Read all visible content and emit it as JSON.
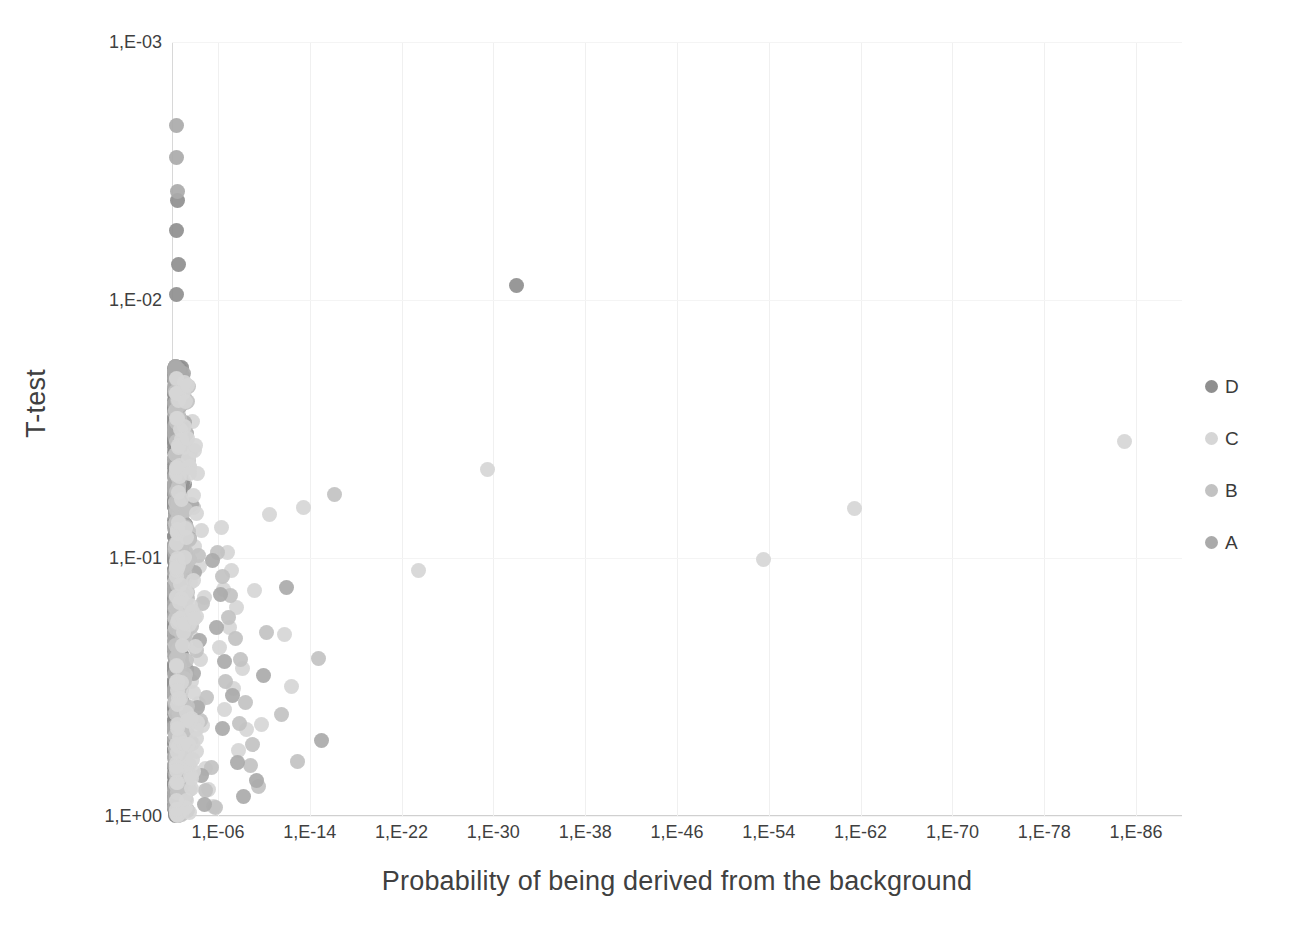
{
  "chart_data": {
    "type": "scatter",
    "title": "",
    "xlabel": "Probability of being derived from the background",
    "ylabel": "T-test",
    "x_tick_labels": [
      "1,E-06",
      "1,E-14",
      "1,E-22",
      "1,E-30",
      "1,E-38",
      "1,E-46",
      "1,E-54",
      "1,E-62",
      "1,E-70",
      "1,E-78",
      "1,E-86"
    ],
    "y_tick_labels": [
      "1,E-03",
      "1,E-02",
      "1,E-01",
      "1,E+00"
    ],
    "x_scale": "log",
    "y_scale": "log",
    "x_axis_note": "Exponent axis decreasing left-to-right from about 1,E-02 to 1,E-90",
    "y_axis_note": "Log axis from 1,E-03 (top) down to 1,E+00 (bottom)",
    "xlim_exponent": [
      -2,
      -90
    ],
    "ylim": [
      0.001,
      1.0
    ],
    "grid": "faint vertical gridlines at each x tick",
    "legend_position": "right",
    "legend": [
      {
        "name": "D",
        "color": "#8f8f8f"
      },
      {
        "name": "C",
        "color": "#d6d6d6"
      },
      {
        "name": "B",
        "color": "#c2c2c2"
      },
      {
        "name": "A",
        "color": "#aaaaaa"
      }
    ],
    "series": [
      {
        "name": "D",
        "color": "#8f8f8f",
        "points": [
          [
            -2.45,
            0.0041
          ],
          [
            -2.35,
            0.0054
          ],
          [
            -2.55,
            0.0073
          ],
          [
            -2.4,
            0.0095
          ],
          [
            -2.3,
            0.0215
          ],
          [
            -2.6,
            0.0218
          ],
          [
            -2.42,
            0.0228
          ],
          [
            -2.52,
            0.0235
          ],
          [
            -2.33,
            0.0243
          ],
          [
            -2.62,
            0.0252
          ],
          [
            -2.48,
            0.0262
          ],
          [
            -2.38,
            0.0271
          ],
          [
            -2.58,
            0.0283
          ],
          [
            -2.28,
            0.0301
          ],
          [
            -2.5,
            0.0318
          ],
          [
            -2.44,
            0.0338
          ],
          [
            -2.36,
            0.0356
          ],
          [
            -2.56,
            0.0372
          ],
          [
            -2.31,
            0.0395
          ],
          [
            -2.46,
            0.0418
          ],
          [
            -2.54,
            0.0442
          ],
          [
            -2.39,
            0.0465
          ],
          [
            -2.61,
            0.0492
          ],
          [
            -2.34,
            0.052
          ],
          [
            -2.49,
            0.0548
          ],
          [
            -2.43,
            0.058
          ],
          [
            -2.57,
            0.0612
          ],
          [
            -2.29,
            0.0648
          ],
          [
            -2.51,
            0.0684
          ],
          [
            -2.41,
            0.0722
          ],
          [
            -2.37,
            0.0762
          ],
          [
            -2.59,
            0.0805
          ],
          [
            -2.47,
            0.085
          ],
          [
            -2.32,
            0.0898
          ],
          [
            -2.53,
            0.0948
          ],
          [
            -2.45,
            0.1
          ],
          [
            -2.27,
            0.1056
          ],
          [
            -2.63,
            0.1115
          ],
          [
            -2.4,
            0.1178
          ],
          [
            -2.55,
            0.1243
          ],
          [
            -2.35,
            0.1312
          ],
          [
            -2.48,
            0.1385
          ],
          [
            -2.58,
            0.1463
          ],
          [
            -2.3,
            0.1544
          ],
          [
            -2.44,
            0.163
          ],
          [
            -2.52,
            0.1721
          ],
          [
            -2.38,
            0.1816
          ],
          [
            -2.6,
            0.1917
          ],
          [
            -2.33,
            0.2024
          ],
          [
            -2.5,
            0.2136
          ],
          [
            -2.42,
            0.2255
          ],
          [
            -2.56,
            0.238
          ],
          [
            -2.28,
            0.2512
          ],
          [
            -2.46,
            0.2651
          ],
          [
            -2.54,
            0.2799
          ],
          [
            -2.36,
            0.2954
          ],
          [
            -2.62,
            0.3118
          ],
          [
            -2.31,
            0.3291
          ],
          [
            -2.49,
            0.3474
          ],
          [
            -2.43,
            0.3666
          ],
          [
            -2.57,
            0.387
          ],
          [
            -2.34,
            0.4085
          ],
          [
            -2.51,
            0.4311
          ],
          [
            -2.39,
            0.455
          ],
          [
            -2.59,
            0.4803
          ],
          [
            -2.29,
            0.5069
          ],
          [
            -2.47,
            0.535
          ],
          [
            -2.53,
            0.5647
          ],
          [
            -2.37,
            0.596
          ],
          [
            -2.61,
            0.6291
          ],
          [
            -2.32,
            0.664
          ],
          [
            -2.45,
            0.7008
          ],
          [
            -2.55,
            0.7397
          ],
          [
            -2.41,
            0.7807
          ],
          [
            -2.27,
            0.824
          ],
          [
            -2.63,
            0.8697
          ],
          [
            -2.4,
            0.918
          ],
          [
            -2.5,
            0.969
          ],
          [
            -2.44,
            0.995
          ],
          [
            -2.7,
            0.0225
          ],
          [
            -2.75,
            0.0237
          ],
          [
            -2.8,
            0.031
          ],
          [
            -2.72,
            0.0432
          ],
          [
            -2.78,
            0.0505
          ],
          [
            -2.85,
            0.064
          ],
          [
            -2.68,
            0.073
          ],
          [
            -2.9,
            0.081
          ],
          [
            -2.74,
            0.0925
          ],
          [
            -2.82,
            0.107
          ],
          [
            -2.66,
            0.119
          ],
          [
            -2.88,
            0.136
          ],
          [
            -2.76,
            0.153
          ],
          [
            -2.7,
            0.175
          ],
          [
            -2.84,
            0.199
          ],
          [
            -2.64,
            0.227
          ],
          [
            -2.92,
            0.258
          ],
          [
            -2.79,
            0.292
          ],
          [
            -2.71,
            0.332
          ],
          [
            -2.86,
            0.376
          ],
          [
            -2.67,
            0.426
          ],
          [
            -2.94,
            0.483
          ],
          [
            -2.77,
            0.546
          ],
          [
            -2.73,
            0.618
          ],
          [
            -2.89,
            0.699
          ],
          [
            -2.65,
            0.79
          ],
          [
            -2.81,
            0.892
          ],
          [
            -2.83,
            0.96
          ],
          [
            -3.05,
            0.052
          ],
          [
            -3.15,
            0.074
          ],
          [
            -3.0,
            0.103
          ],
          [
            -3.22,
            0.142
          ],
          [
            -3.1,
            0.196
          ],
          [
            -3.3,
            0.27
          ],
          [
            -3.08,
            0.372
          ],
          [
            -3.25,
            0.512
          ],
          [
            -3.02,
            0.69
          ],
          [
            -3.18,
            0.86
          ],
          [
            -3.35,
            0.95
          ],
          [
            -32.0,
            0.0088
          ]
        ]
      },
      {
        "name": "C",
        "color": "#d6d6d6",
        "points": [
          [
            -2.45,
            0.0205
          ],
          [
            -2.55,
            0.0268
          ],
          [
            -2.38,
            0.034
          ],
          [
            -2.62,
            0.043
          ],
          [
            -2.48,
            0.0545
          ],
          [
            -2.33,
            0.069
          ],
          [
            -2.58,
            0.0875
          ],
          [
            -2.42,
            0.1105
          ],
          [
            -2.52,
            0.14
          ],
          [
            -2.36,
            0.177
          ],
          [
            -2.65,
            0.224
          ],
          [
            -2.46,
            0.284
          ],
          [
            -2.56,
            0.359
          ],
          [
            -2.31,
            0.455
          ],
          [
            -2.5,
            0.576
          ],
          [
            -2.4,
            0.729
          ],
          [
            -2.6,
            0.922
          ],
          [
            -3.8,
            0.0295
          ],
          [
            -4.2,
            0.047
          ],
          [
            -3.5,
            0.062
          ],
          [
            -4.6,
            0.078
          ],
          [
            -4.0,
            0.0905
          ],
          [
            -4.4,
            0.108
          ],
          [
            -3.6,
            0.124
          ],
          [
            -4.8,
            0.142
          ],
          [
            -4.1,
            0.168
          ],
          [
            -3.9,
            0.205
          ],
          [
            -4.5,
            0.248
          ],
          [
            -3.7,
            0.302
          ],
          [
            -4.3,
            0.368
          ],
          [
            -4.7,
            0.445
          ],
          [
            -3.4,
            0.54
          ],
          [
            -4.9,
            0.655
          ],
          [
            -5.2,
            0.79
          ],
          [
            -5.6,
            0.92
          ],
          [
            -6.3,
            0.076
          ],
          [
            -6.8,
            0.095
          ],
          [
            -7.2,
            0.112
          ],
          [
            -6.5,
            0.133
          ],
          [
            -7.6,
            0.156
          ],
          [
            -7.0,
            0.186
          ],
          [
            -6.1,
            0.223
          ],
          [
            -8.1,
            0.267
          ],
          [
            -7.4,
            0.32
          ],
          [
            -6.6,
            0.385
          ],
          [
            -8.5,
            0.462
          ],
          [
            -7.8,
            0.555
          ],
          [
            -9.2,
            0.134
          ],
          [
            -10.5,
            0.068
          ],
          [
            -13.5,
            0.064
          ],
          [
            -11.8,
            0.198
          ],
          [
            -12.4,
            0.315
          ],
          [
            -9.8,
            0.44
          ],
          [
            -23.5,
            0.112
          ],
          [
            -29.5,
            0.0455
          ],
          [
            -53.5,
            0.101
          ],
          [
            -61.5,
            0.0645
          ],
          [
            -85.0,
            0.0355
          ]
        ]
      },
      {
        "name": "B",
        "color": "#c2c2c2",
        "points": [
          [
            -2.42,
            0.0212
          ],
          [
            -2.52,
            0.0276
          ],
          [
            -2.35,
            0.0358
          ],
          [
            -2.6,
            0.0464
          ],
          [
            -2.47,
            0.06
          ],
          [
            -2.3,
            0.0776
          ],
          [
            -2.56,
            0.1
          ],
          [
            -2.44,
            0.129
          ],
          [
            -2.38,
            0.166
          ],
          [
            -2.63,
            0.214
          ],
          [
            -2.5,
            0.276
          ],
          [
            -2.33,
            0.355
          ],
          [
            -2.58,
            0.457
          ],
          [
            -2.41,
            0.588
          ],
          [
            -2.54,
            0.756
          ],
          [
            -2.36,
            0.94
          ],
          [
            -3.2,
            0.025
          ],
          [
            -3.6,
            0.039
          ],
          [
            -3.0,
            0.0505
          ],
          [
            -3.9,
            0.0635
          ],
          [
            -3.4,
            0.079
          ],
          [
            -4.3,
            0.098
          ],
          [
            -3.1,
            0.121
          ],
          [
            -4.7,
            0.15
          ],
          [
            -3.7,
            0.185
          ],
          [
            -4.1,
            0.228
          ],
          [
            -3.3,
            0.281
          ],
          [
            -5.0,
            0.346
          ],
          [
            -4.5,
            0.426
          ],
          [
            -3.8,
            0.525
          ],
          [
            -5.4,
            0.646
          ],
          [
            -4.9,
            0.796
          ],
          [
            -5.8,
            0.93
          ],
          [
            -6.0,
            0.0955
          ],
          [
            -6.4,
            0.118
          ],
          [
            -7.1,
            0.14
          ],
          [
            -6.9,
            0.17
          ],
          [
            -7.5,
            0.205
          ],
          [
            -8.0,
            0.248
          ],
          [
            -6.7,
            0.3
          ],
          [
            -8.4,
            0.362
          ],
          [
            -7.9,
            0.437
          ],
          [
            -9.0,
            0.528
          ],
          [
            -8.8,
            0.638
          ],
          [
            -9.5,
            0.77
          ],
          [
            -10.2,
            0.195
          ],
          [
            -11.5,
            0.405
          ],
          [
            -14.8,
            0.245
          ],
          [
            -12.9,
            0.615
          ],
          [
            -16.2,
            0.0565
          ]
        ]
      },
      {
        "name": "A",
        "color": "#aaaaaa",
        "points": [
          [
            -2.43,
            0.0021
          ],
          [
            -2.36,
            0.0028
          ],
          [
            -2.52,
            0.0038
          ],
          [
            -2.48,
            0.0218
          ],
          [
            -2.58,
            0.0295
          ],
          [
            -2.34,
            0.04
          ],
          [
            -2.62,
            0.054
          ],
          [
            -2.45,
            0.073
          ],
          [
            -2.39,
            0.0988
          ],
          [
            -2.55,
            0.1335
          ],
          [
            -2.31,
            0.1805
          ],
          [
            -2.6,
            0.244
          ],
          [
            -2.49,
            0.33
          ],
          [
            -2.42,
            0.446
          ],
          [
            -2.53,
            0.603
          ],
          [
            -2.37,
            0.815
          ],
          [
            -2.57,
            0.975
          ],
          [
            -2.95,
            0.0228
          ],
          [
            -3.3,
            0.033
          ],
          [
            -3.1,
            0.0455
          ],
          [
            -3.7,
            0.062
          ],
          [
            -3.5,
            0.084
          ],
          [
            -4.0,
            0.114
          ],
          [
            -3.2,
            0.154
          ],
          [
            -4.4,
            0.208
          ],
          [
            -3.9,
            0.281
          ],
          [
            -4.2,
            0.38
          ],
          [
            -3.6,
            0.514
          ],
          [
            -4.6,
            0.694
          ],
          [
            -4.8,
            0.9
          ],
          [
            -5.5,
            0.102
          ],
          [
            -6.2,
            0.138
          ],
          [
            -5.9,
            0.186
          ],
          [
            -6.6,
            0.252
          ],
          [
            -7.3,
            0.34
          ],
          [
            -6.4,
            0.459
          ],
          [
            -7.7,
            0.62
          ],
          [
            -8.2,
            0.838
          ],
          [
            -10.0,
            0.285
          ],
          [
            -12.0,
            0.13
          ],
          [
            -15.0,
            0.51
          ],
          [
            -9.4,
            0.73
          ]
        ]
      }
    ]
  }
}
